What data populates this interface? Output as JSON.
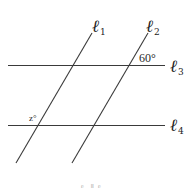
{
  "diagram": {
    "type": "parallel-lines-transversals",
    "lines": [
      {
        "id": "l1",
        "label": "ℓ",
        "subscript": "1",
        "kind": "transversal"
      },
      {
        "id": "l2",
        "label": "ℓ",
        "subscript": "2",
        "kind": "transversal"
      },
      {
        "id": "l3",
        "label": "ℓ",
        "subscript": "3",
        "kind": "horizontal"
      },
      {
        "id": "l4",
        "label": "ℓ",
        "subscript": "4",
        "kind": "horizontal"
      }
    ],
    "angles": [
      {
        "label": "60°",
        "at": "intersection of ℓ2 and ℓ3",
        "position": "above-right"
      },
      {
        "label": "z°",
        "at": "intersection of ℓ1 and ℓ4",
        "position": "above-left"
      }
    ],
    "caption": "ℓ₁ ∥ ℓ₂"
  }
}
